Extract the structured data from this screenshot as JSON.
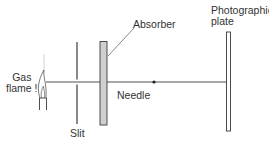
{
  "diagram": {
    "labels": {
      "gas_flame": [
        "Gas",
        "flame !"
      ],
      "slit": "Slit",
      "absorber": "Absorber",
      "needle": "Needle",
      "photographic_plate": [
        "Photographic",
        "plate"
      ]
    },
    "colors": {
      "line": "#3a3a3a",
      "absorber_fill": "#cfcfcf",
      "plate_fill": "#ffffff",
      "text": "#333333",
      "background": "#ffffff"
    }
  }
}
